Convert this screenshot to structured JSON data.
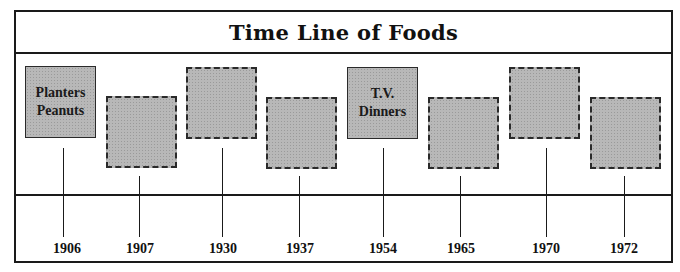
{
  "diagram": {
    "title": "Time Line of Foods",
    "events": [
      {
        "year": "1906",
        "label": "Planters\nPeanuts",
        "style": "solid",
        "filled_in": true
      },
      {
        "year": "1907",
        "label": "",
        "style": "dashed",
        "filled_in": false
      },
      {
        "year": "1930",
        "label": "",
        "style": "dashed",
        "filled_in": false
      },
      {
        "year": "1937",
        "label": "",
        "style": "dashed",
        "filled_in": false
      },
      {
        "year": "1954",
        "label": "T.V.\nDinners",
        "style": "solid",
        "filled_in": true
      },
      {
        "year": "1965",
        "label": "",
        "style": "dashed",
        "filled_in": false
      },
      {
        "year": "1970",
        "label": "",
        "style": "dashed",
        "filled_in": false
      },
      {
        "year": "1972",
        "label": "",
        "style": "dashed",
        "filled_in": false
      }
    ],
    "colors": {
      "box_fill": "#b8b8b8",
      "line": "#1a1a1a",
      "background": "#ffffff"
    }
  }
}
